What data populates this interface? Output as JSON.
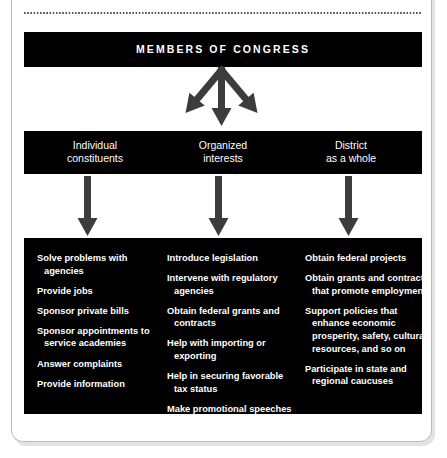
{
  "figure": {
    "heading": "THEIR DISTRICTS",
    "top_box_label": "MEMBERS OF CONGRESS",
    "targets": [
      {
        "line1": "Individual",
        "line2": "constituents"
      },
      {
        "line1": "Organized",
        "line2": "interests"
      },
      {
        "line1": "District",
        "line2": "as a whole"
      }
    ],
    "action_columns": [
      {
        "items": [
          "Solve problems with agencies",
          "Provide jobs",
          "Sponsor private bills",
          "Sponsor appointments to service academies",
          "Answer complaints",
          "Provide information"
        ]
      },
      {
        "items": [
          "Introduce legislation",
          "Intervene with regulatory agencies",
          "Obtain federal grants and contracts",
          "Help with importing or exporting",
          "Help in securing favorable tax status",
          "Make promotional speeches and symbolic gestures"
        ]
      },
      {
        "items": [
          "Obtain federal projects",
          "Obtain grants and contracts that promote employment",
          "Support policies that enhance economic prosperity, safety, cultural resources, and so on",
          "Participate in state and regional caucuses"
        ]
      }
    ],
    "colors": {
      "box_fill": "#000000",
      "box_text": "#ffffff",
      "arrow": "#3c3c3c",
      "card_border": "#b9b9b9",
      "page_background": "#ffffff",
      "rule": "#555555"
    }
  }
}
